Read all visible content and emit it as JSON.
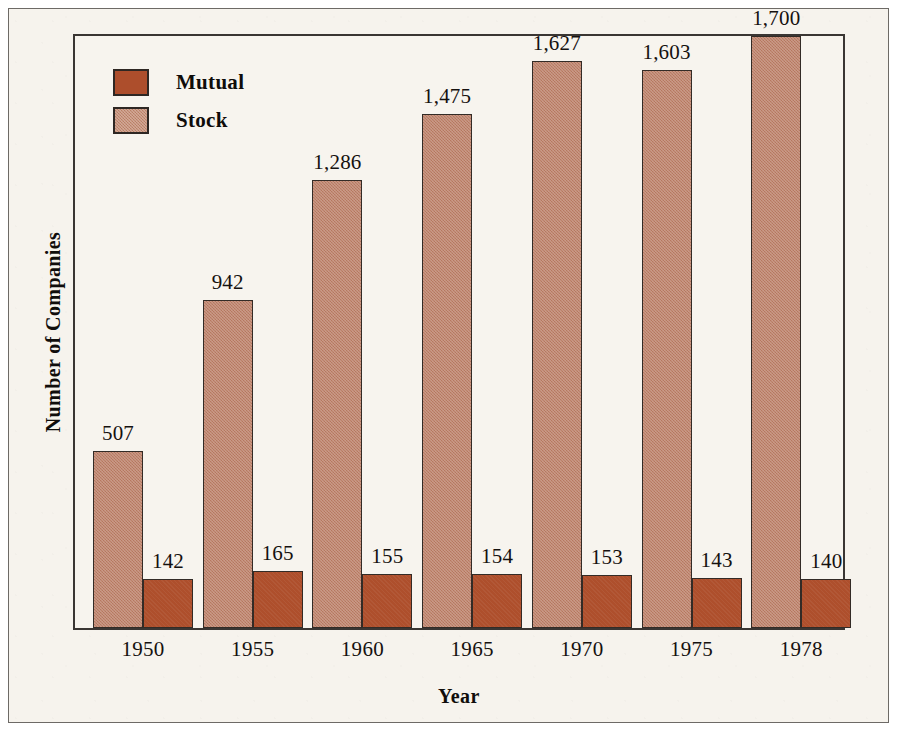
{
  "chart_data": {
    "type": "bar",
    "title": "",
    "xlabel": "Year",
    "ylabel": "Number of Companies",
    "categories": [
      "1950",
      "1955",
      "1960",
      "1965",
      "1970",
      "1975",
      "1978"
    ],
    "series": [
      {
        "name": "Stock",
        "color": "#bd8169",
        "values": [
          507,
          942,
          1286,
          1475,
          1627,
          1603,
          1700
        ],
        "labels": [
          "507",
          "942",
          "1,286",
          "1,475",
          "1,627",
          "1,603",
          "1,700"
        ]
      },
      {
        "name": "Mutual",
        "color": "#ae4f2c",
        "values": [
          142,
          165,
          155,
          154,
          153,
          143,
          140
        ],
        "labels": [
          "142",
          "165",
          "155",
          "154",
          "153",
          "143",
          "140"
        ]
      }
    ],
    "ylim": [
      0,
      1700
    ],
    "grid": false,
    "legend_position": "top-left",
    "axis_ticks_shown": false,
    "data_labels_shown": true
  },
  "legend": {
    "entries": [
      {
        "label": "Mutual",
        "swatch": "mutual-swatch"
      },
      {
        "label": "Stock",
        "swatch": "stock-swatch"
      }
    ]
  },
  "axes": {
    "y_title": "Number of Companies",
    "x_title": "Year"
  }
}
